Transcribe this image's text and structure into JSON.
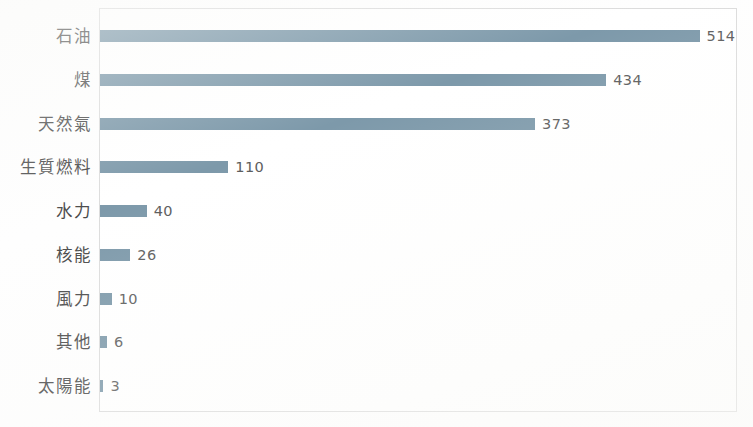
{
  "chart_data": {
    "type": "bar",
    "orientation": "horizontal",
    "title": "",
    "subtitle": "",
    "xlabel": "",
    "ylabel": "",
    "categories": [
      "石油",
      "煤",
      "天然氣",
      "生質燃料",
      "水力",
      "核能",
      "風力",
      "其他",
      "太陽能"
    ],
    "values": [
      514,
      434,
      373,
      110,
      40,
      26,
      10,
      6,
      3
    ],
    "data_labels": [
      "514",
      "434",
      "373",
      "110",
      "40",
      "26",
      "10",
      "6",
      "3"
    ],
    "xlim": [
      0,
      547
    ],
    "ylim": null,
    "grid": false,
    "legend": null,
    "legend_position": "none",
    "tick_labels_x": [],
    "tick_labels_y": [
      "石油",
      "煤",
      "天然氣",
      "生質燃料",
      "水力",
      "核能",
      "風力",
      "其他",
      "太陽能"
    ],
    "annotations": [],
    "series": [
      {
        "name": "",
        "values": [
          514,
          434,
          373,
          110,
          40,
          26,
          10,
          6,
          3
        ]
      }
    ],
    "colors": {
      "bar": "#7d99aa",
      "plot_border": "#dcdcdc",
      "background": "#fefefe",
      "label_text": "#4a4a4a",
      "value_text": "#5b5b5b"
    }
  }
}
